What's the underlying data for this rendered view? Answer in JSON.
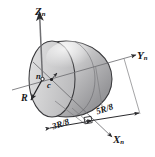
{
  "figure": {
    "background_color": "#ffffff",
    "line_color": "#2b2b2e",
    "body": {
      "shape": "hemisphere",
      "fill_light": "#e9e9ea",
      "fill_mid": "#c9c9ca",
      "fill_dark": "#9a9a9c"
    }
  },
  "axes": {
    "z": {
      "label_base": "Z",
      "label_sub": "n",
      "direction": "up"
    },
    "y": {
      "label_base": "Y",
      "label_sub": "n",
      "direction": "upper-right"
    },
    "x": {
      "label_base": "X",
      "label_sub": "n",
      "direction": "lower-right"
    }
  },
  "points": {
    "n": {
      "label": "n",
      "description": "neutral-axis point"
    },
    "c": {
      "label": "c",
      "description": "centroid"
    }
  },
  "dimensions": {
    "radius": {
      "label": "R"
    },
    "offset_3R8": {
      "label": "3R/8"
    },
    "offset_5R8": {
      "label": "5R/8"
    },
    "right_angle_marker": true
  }
}
